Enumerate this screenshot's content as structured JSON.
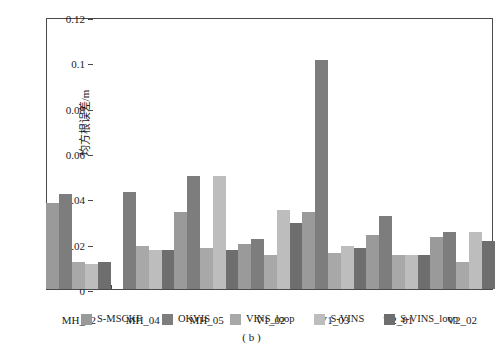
{
  "caption": "( b )",
  "chart_data": {
    "type": "bar",
    "title": "",
    "subtitle": "",
    "xlabel": "",
    "ylabel": "均方根误差/m",
    "ylim": [
      0,
      0.12
    ],
    "ytick_labels": [
      "0",
      "0.02",
      "0.04",
      "0.06",
      "0.08",
      "0.1",
      "0.12"
    ],
    "ytick_values": [
      0,
      0.02,
      0.04,
      0.06,
      0.08,
      0.1,
      0.12
    ],
    "grid": false,
    "legend_position": "bottom",
    "categories": [
      "MH_02",
      "MH_04",
      "MH_05",
      "V1_02",
      "V1_03",
      "V2_01",
      "V2_02"
    ],
    "series": [
      {
        "name": "S-MSCKF",
        "color": "#9a9a9a",
        "values": [
          0.038,
          0.0,
          0.034,
          0.02,
          0.034,
          0.024,
          0.023
        ]
      },
      {
        "name": "OKVIS",
        "color": "#7d7d7d",
        "values": [
          0.042,
          0.043,
          0.05,
          0.022,
          0.101,
          0.032,
          0.025
        ]
      },
      {
        "name": "VINS_loop",
        "color": "#a8a8a8",
        "values": [
          0.012,
          0.019,
          0.018,
          0.015,
          0.016,
          0.015,
          0.012
        ]
      },
      {
        "name": "S-VINS",
        "color": "#bdbdbd",
        "values": [
          0.011,
          0.017,
          0.05,
          0.035,
          0.019,
          0.015,
          0.025
        ]
      },
      {
        "name": "S-VINS_loop",
        "color": "#6e6e6e",
        "values": [
          0.012,
          0.017,
          0.017,
          0.029,
          0.018,
          0.015,
          0.021
        ]
      }
    ]
  }
}
